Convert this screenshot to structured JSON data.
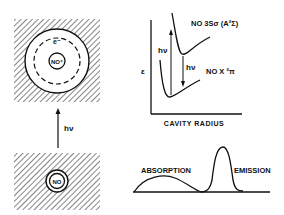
{
  "excited_cavity": {
    "electron_label": "e⁻",
    "ion_label": "NO⁺"
  },
  "ground_cavity": {
    "molecule_label": "NO"
  },
  "excitation_arrow_label": "hν",
  "energy_diagram": {
    "y_axis_label": "ε",
    "x_axis_label": "CAVITY RADIUS",
    "upper_state_label": "NO 3Sσ (A²Σ)",
    "lower_state_label": "NO X ²π",
    "absorption_label": "hν",
    "emission_label": "hν"
  },
  "spectrum": {
    "absorption_label": "ABSORPTION",
    "emission_label": "EMISSION"
  }
}
